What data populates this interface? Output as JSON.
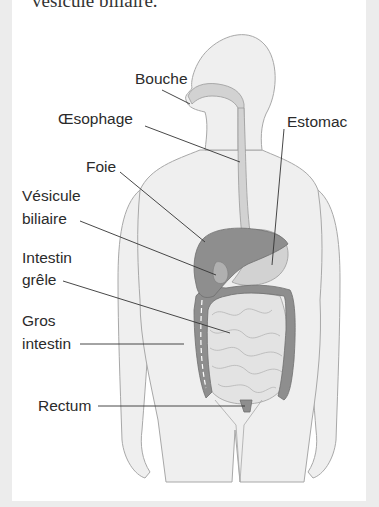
{
  "caption_fragment": "vésicule biliaire.",
  "diagram": {
    "labels": {
      "bouche": "Bouche",
      "oesophage": "Œsophage",
      "estomac": "Estomac",
      "foie": "Foie",
      "vesicule_1": "Vésicule",
      "vesicule_2": "biliaire",
      "intestin_grele_1": "Intestin",
      "intestin_grele_2": "grêle",
      "gros_intestin_1": "Gros",
      "gros_intestin_2": "intestin",
      "rectum": "Rectum"
    },
    "colors": {
      "body_fill": "#efefef",
      "body_outline": "#a8a8a8",
      "tract_light": "#d2d2d2",
      "organ_dark": "#8e8e8e",
      "intestine_mid": "#c8c8c8",
      "leader_line": "#333333",
      "background": "#ececec",
      "panel": "#ffffff"
    }
  }
}
